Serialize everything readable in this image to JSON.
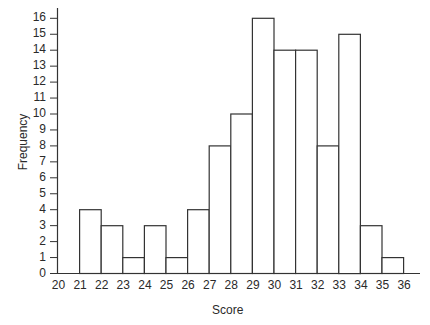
{
  "chart_data": {
    "type": "bar",
    "title": "",
    "xlabel": "Score",
    "ylabel": "Frequency",
    "categories": [
      "20",
      "21",
      "22",
      "23",
      "24",
      "25",
      "26",
      "27",
      "28",
      "29",
      "30",
      "31",
      "32",
      "33",
      "34",
      "35",
      "36"
    ],
    "values": [
      0,
      4,
      3,
      1,
      3,
      1,
      4,
      8,
      10,
      16,
      14,
      14,
      8,
      15,
      3,
      1,
      0
    ],
    "ylim": [
      0,
      16
    ],
    "yticks": [
      0,
      1,
      2,
      3,
      4,
      5,
      6,
      7,
      8,
      9,
      10,
      11,
      12,
      13,
      14,
      15,
      16
    ],
    "grid": false,
    "legend": null,
    "bar_style": {
      "fill": "#ffffff",
      "stroke": "#333333"
    }
  },
  "labels": {
    "xlabel": "Score",
    "ylabel": "Frequency"
  }
}
